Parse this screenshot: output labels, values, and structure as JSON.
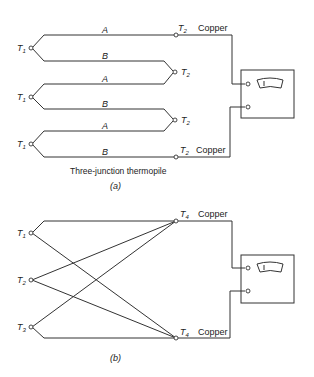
{
  "figure_a": {
    "caption": "Three-junction thermopile",
    "label": "(a)",
    "wire_labels": [
      "A",
      "B",
      "A",
      "B",
      "A",
      "B"
    ],
    "cold_junctions": [
      "T",
      "T",
      "T"
    ],
    "cold_sub": "1",
    "hot_junctions": [
      "T",
      "T",
      "T",
      "T"
    ],
    "hot_sub": "2",
    "lead_labels": [
      "Copper",
      "Copper"
    ]
  },
  "figure_b": {
    "label": "(b)",
    "junctions": [
      {
        "t": "T",
        "s": "1"
      },
      {
        "t": "T",
        "s": "2"
      },
      {
        "t": "T",
        "s": "3"
      }
    ],
    "ref_junctions": [
      "T",
      "T"
    ],
    "ref_sub": "4",
    "lead_labels": [
      "Copper",
      "Copper"
    ]
  },
  "colors": {
    "line": "#333333",
    "background": "#ffffff"
  }
}
